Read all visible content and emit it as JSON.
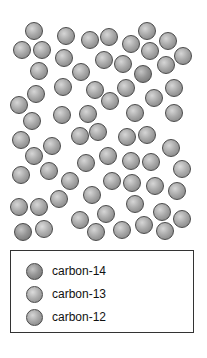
{
  "diagram": {
    "atom_diameter": 18,
    "atoms": [
      {
        "x": 34,
        "y": 31,
        "t": "c12"
      },
      {
        "x": 66,
        "y": 36,
        "t": "c12"
      },
      {
        "x": 90,
        "y": 40,
        "t": "c12"
      },
      {
        "x": 109,
        "y": 37,
        "t": "c12"
      },
      {
        "x": 131,
        "y": 44,
        "t": "c12"
      },
      {
        "x": 147,
        "y": 31,
        "t": "c12"
      },
      {
        "x": 168,
        "y": 41,
        "t": "c12"
      },
      {
        "x": 22,
        "y": 50,
        "t": "c12"
      },
      {
        "x": 42,
        "y": 50,
        "t": "c12"
      },
      {
        "x": 64,
        "y": 58,
        "t": "c12"
      },
      {
        "x": 104,
        "y": 60,
        "t": "c12"
      },
      {
        "x": 123,
        "y": 64,
        "t": "c12"
      },
      {
        "x": 150,
        "y": 51,
        "t": "c12"
      },
      {
        "x": 166,
        "y": 65,
        "t": "c12"
      },
      {
        "x": 183,
        "y": 56,
        "t": "c12"
      },
      {
        "x": 39,
        "y": 71,
        "t": "c12"
      },
      {
        "x": 81,
        "y": 72,
        "t": "c12"
      },
      {
        "x": 143,
        "y": 74,
        "t": "c14"
      },
      {
        "x": 63,
        "y": 87,
        "t": "c12"
      },
      {
        "x": 95,
        "y": 90,
        "t": "c12"
      },
      {
        "x": 126,
        "y": 88,
        "t": "c12"
      },
      {
        "x": 36,
        "y": 94,
        "t": "c12"
      },
      {
        "x": 110,
        "y": 101,
        "t": "c12"
      },
      {
        "x": 154,
        "y": 98,
        "t": "c12"
      },
      {
        "x": 174,
        "y": 88,
        "t": "c12"
      },
      {
        "x": 19,
        "y": 105,
        "t": "c12"
      },
      {
        "x": 62,
        "y": 115,
        "t": "c12"
      },
      {
        "x": 88,
        "y": 114,
        "t": "c12"
      },
      {
        "x": 135,
        "y": 113,
        "t": "c12"
      },
      {
        "x": 174,
        "y": 113,
        "t": "c12"
      },
      {
        "x": 32,
        "y": 121,
        "t": "c12"
      },
      {
        "x": 21,
        "y": 140,
        "t": "c12"
      },
      {
        "x": 52,
        "y": 146,
        "t": "c12"
      },
      {
        "x": 80,
        "y": 136,
        "t": "c12"
      },
      {
        "x": 98,
        "y": 132,
        "t": "c12"
      },
      {
        "x": 127,
        "y": 137,
        "t": "c12"
      },
      {
        "x": 147,
        "y": 135,
        "t": "c12"
      },
      {
        "x": 171,
        "y": 148,
        "t": "c12"
      },
      {
        "x": 34,
        "y": 156,
        "t": "c12"
      },
      {
        "x": 86,
        "y": 163,
        "t": "c12"
      },
      {
        "x": 108,
        "y": 156,
        "t": "c12"
      },
      {
        "x": 131,
        "y": 161,
        "t": "c12"
      },
      {
        "x": 151,
        "y": 162,
        "t": "c12"
      },
      {
        "x": 182,
        "y": 169,
        "t": "c13"
      },
      {
        "x": 21,
        "y": 175,
        "t": "c12"
      },
      {
        "x": 49,
        "y": 171,
        "t": "c12"
      },
      {
        "x": 70,
        "y": 181,
        "t": "c12"
      },
      {
        "x": 112,
        "y": 181,
        "t": "c12"
      },
      {
        "x": 132,
        "y": 183,
        "t": "c12"
      },
      {
        "x": 155,
        "y": 186,
        "t": "c12"
      },
      {
        "x": 177,
        "y": 191,
        "t": "c12"
      },
      {
        "x": 59,
        "y": 199,
        "t": "c12"
      },
      {
        "x": 92,
        "y": 195,
        "t": "c12"
      },
      {
        "x": 135,
        "y": 204,
        "t": "c12"
      },
      {
        "x": 19,
        "y": 207,
        "t": "c12"
      },
      {
        "x": 39,
        "y": 207,
        "t": "c12"
      },
      {
        "x": 162,
        "y": 212,
        "t": "c12"
      },
      {
        "x": 182,
        "y": 219,
        "t": "c12"
      },
      {
        "x": 80,
        "y": 220,
        "t": "c12"
      },
      {
        "x": 106,
        "y": 214,
        "t": "c12"
      },
      {
        "x": 144,
        "y": 225,
        "t": "c12"
      },
      {
        "x": 23,
        "y": 232,
        "t": "c14"
      },
      {
        "x": 44,
        "y": 229,
        "t": "c13"
      },
      {
        "x": 96,
        "y": 232,
        "t": "c12"
      },
      {
        "x": 122,
        "y": 230,
        "t": "c12"
      },
      {
        "x": 165,
        "y": 231,
        "t": "c12"
      }
    ]
  },
  "legend": {
    "items": [
      {
        "label": "carbon-14",
        "type": "c14"
      },
      {
        "label": "carbon-13",
        "type": "c13"
      },
      {
        "label": "carbon-12",
        "type": "c12"
      }
    ]
  }
}
